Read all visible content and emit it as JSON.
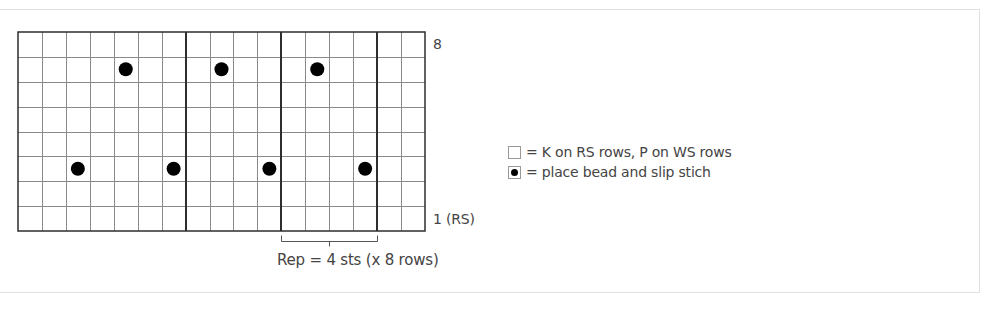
{
  "chart_data": {
    "type": "table",
    "title": "",
    "grid": {
      "columns": 17,
      "rows": 8,
      "repeat_dividers_after_column": [
        7,
        11,
        15
      ]
    },
    "row_labels": {
      "top": "8",
      "bottom": "1 (RS)"
    },
    "beads": [
      {
        "row": 7,
        "column": 5
      },
      {
        "row": 7,
        "column": 9
      },
      {
        "row": 7,
        "column": 13
      },
      {
        "row": 3,
        "column": 3
      },
      {
        "row": 3,
        "column": 7
      },
      {
        "row": 3,
        "column": 11
      },
      {
        "row": 3,
        "column": 15
      }
    ],
    "repeat": {
      "from_column": 12,
      "to_column": 15,
      "label": "Rep = 4 sts (x 8 rows)"
    },
    "legend": [
      {
        "symbol": "empty-square",
        "label": "= K on RS rows, P on WS rows"
      },
      {
        "symbol": "filled-dot",
        "label": "= place bead and slip stich"
      }
    ]
  },
  "labels": {
    "top_row": "8",
    "bottom_row": "1 (RS)",
    "repeat": "Rep = 4 sts (x 8 rows)"
  },
  "legend": {
    "items": [
      {
        "label": "= K on RS rows, P on WS rows"
      },
      {
        "label": "= place bead and slip stich"
      }
    ]
  },
  "colors": {
    "grid_thin": "#8a8a8a",
    "grid_thick": "#2e2e2e",
    "bead": "#000000",
    "text": "#444444",
    "frame": "#e0e0e0"
  }
}
